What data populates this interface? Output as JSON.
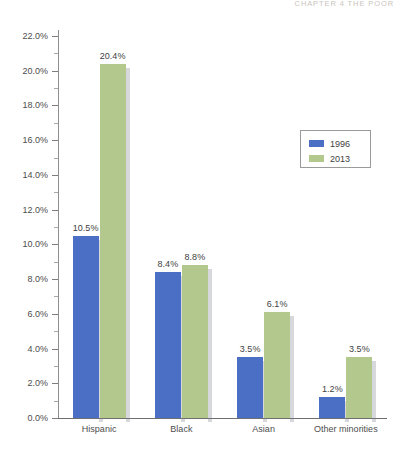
{
  "page_header": "CHAPTER 4   THE POOR",
  "legend": {
    "entries": [
      {
        "label": "1996",
        "color": "#4a6fc4"
      },
      {
        "label": "2013",
        "color": "#b2c88c"
      }
    ]
  },
  "chart_data": {
    "type": "bar",
    "title": "",
    "xlabel": "",
    "ylabel": "",
    "ylim": [
      0,
      22
    ],
    "ytick_labels": [
      "0.0%",
      "2.0%",
      "4.0%",
      "6.0%",
      "8.0%",
      "10.0%",
      "12.0%",
      "14.0%",
      "16.0%",
      "18.0%",
      "20.0%",
      "22.0%"
    ],
    "ytick_values": [
      0,
      2,
      4,
      6,
      8,
      10,
      12,
      14,
      16,
      18,
      20,
      22
    ],
    "grid": false,
    "legend_position": "upper right",
    "categories": [
      "Hispanic",
      "Black",
      "Asian",
      "Other minorities"
    ],
    "series": [
      {
        "name": "1996",
        "color": "#4a6fc4",
        "values": [
          10.5,
          8.4,
          3.5,
          1.2
        ],
        "labels": [
          "10.5%",
          "8.4%",
          "3.5%",
          "1.2%"
        ]
      },
      {
        "name": "2013",
        "color": "#b2c88c",
        "values": [
          20.4,
          8.8,
          6.1,
          3.5
        ],
        "labels": [
          "20.4%",
          "8.8%",
          "6.1%",
          "3.5%"
        ]
      }
    ]
  }
}
